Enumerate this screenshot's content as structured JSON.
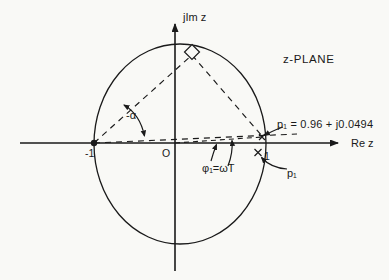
{
  "diagram": {
    "title": "z-PLANE",
    "colors": {
      "background": "#f9f9f6",
      "ink": "#1a1a1a"
    },
    "axes": {
      "imag_label": "jIm z",
      "real_label": "Re z",
      "origin_label": "O",
      "tick_minus_one": "-1",
      "tick_one": "1"
    },
    "angles": {
      "alpha_label": "-α",
      "phi_label": "φ₁=ωT"
    },
    "poles": {
      "p1_label": "p₁ = 0.96 + j0.0494",
      "p1_re": 0.96,
      "p1_im": 0.0494,
      "p1_conjugate_label": "p₁"
    }
  }
}
